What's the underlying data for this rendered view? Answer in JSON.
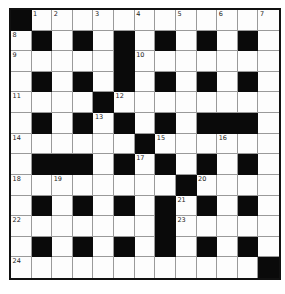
{
  "puzzle": {
    "rows": 13,
    "cols": 13,
    "colors": {
      "black": "#0a0a0a",
      "white": "#fdfdfd",
      "gridline": "#9a9a9a",
      "border": "#111111"
    },
    "layout": [
      "#............",
      ".#.#.#.#.#.#.",
      ".....#.......",
      ".#.#.#.#.#.#.",
      "....#........",
      ".#.#.#.#.###.",
      "......#......",
      ".###.#.#.#.#.",
      "........#....",
      ".#.#.#.#.#.#.",
      ".......#.....",
      ".#.#.#.#.#.#.",
      "............#"
    ],
    "numbers": [
      {
        "r": 0,
        "c": 1,
        "n": "1"
      },
      {
        "r": 0,
        "c": 2,
        "n": "2"
      },
      {
        "r": 0,
        "c": 4,
        "n": "3"
      },
      {
        "r": 0,
        "c": 6,
        "n": "4"
      },
      {
        "r": 0,
        "c": 8,
        "n": "5"
      },
      {
        "r": 0,
        "c": 10,
        "n": "6"
      },
      {
        "r": 0,
        "c": 12,
        "n": "7"
      },
      {
        "r": 1,
        "c": 0,
        "n": "8"
      },
      {
        "r": 2,
        "c": 0,
        "n": "9"
      },
      {
        "r": 2,
        "c": 6,
        "n": "10"
      },
      {
        "r": 4,
        "c": 0,
        "n": "11"
      },
      {
        "r": 4,
        "c": 5,
        "n": "12"
      },
      {
        "r": 5,
        "c": 4,
        "n": "13"
      },
      {
        "r": 6,
        "c": 0,
        "n": "14"
      },
      {
        "r": 6,
        "c": 7,
        "n": "15"
      },
      {
        "r": 6,
        "c": 10,
        "n": "16"
      },
      {
        "r": 7,
        "c": 6,
        "n": "17"
      },
      {
        "r": 8,
        "c": 0,
        "n": "18"
      },
      {
        "r": 8,
        "c": 2,
        "n": "19"
      },
      {
        "r": 8,
        "c": 9,
        "n": "20"
      },
      {
        "r": 9,
        "c": 8,
        "n": "21"
      },
      {
        "r": 10,
        "c": 0,
        "n": "22"
      },
      {
        "r": 10,
        "c": 8,
        "n": "23"
      },
      {
        "r": 12,
        "c": 0,
        "n": "24"
      }
    ]
  }
}
